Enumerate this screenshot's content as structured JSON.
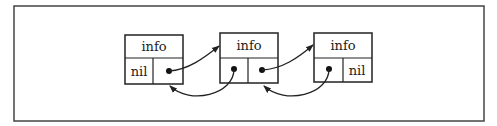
{
  "diagram": {
    "type": "doubly-linked-list",
    "frame": {
      "x": 14,
      "y": 6,
      "w": 470,
      "h": 115
    },
    "nodes": [
      {
        "info": "info",
        "prev": "nil",
        "next": "pointer",
        "x": 125,
        "y": 35,
        "w": 58,
        "h": 49,
        "split_y": 58,
        "split_x": 153
      },
      {
        "info": "info",
        "prev": "pointer",
        "next": "pointer",
        "x": 220,
        "y": 33,
        "w": 58,
        "h": 50,
        "split_y": 58,
        "split_x": 248
      },
      {
        "info": "info",
        "prev": "pointer",
        "next": "nil",
        "x": 314,
        "y": 33,
        "w": 58,
        "h": 49,
        "split_y": 58,
        "split_x": 343
      }
    ],
    "edges": [
      {
        "from": "node1.next",
        "to": "node2.info",
        "direction": "forward"
      },
      {
        "from": "node2.prev",
        "to": "node1.bottom",
        "direction": "backward"
      },
      {
        "from": "node2.next",
        "to": "node3.info",
        "direction": "forward"
      },
      {
        "from": "node3.prev",
        "to": "node2.bottom",
        "direction": "backward"
      }
    ],
    "colors": {
      "stroke": "#222222",
      "frame": "#444444",
      "background": "#ffffff"
    }
  }
}
